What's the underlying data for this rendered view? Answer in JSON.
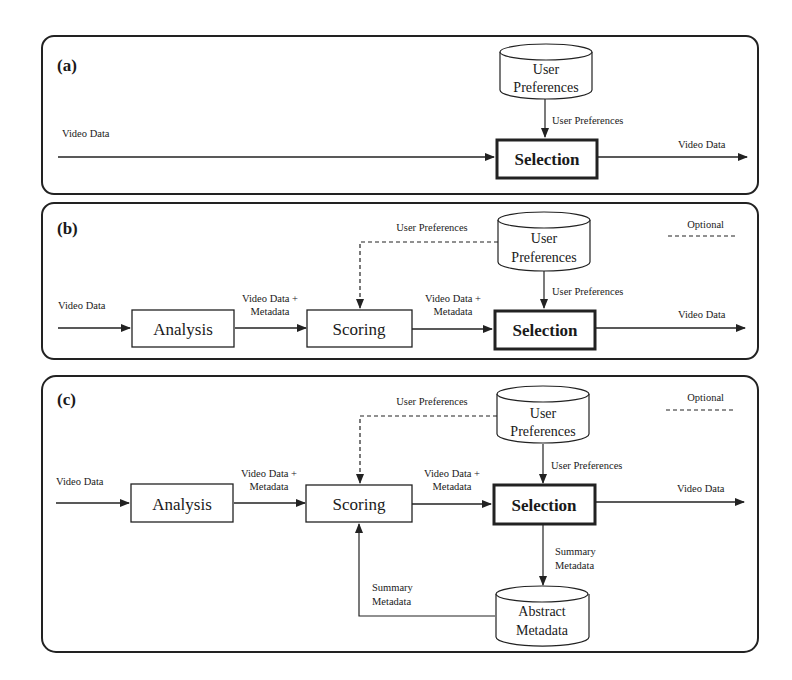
{
  "panels": [
    {
      "label": "(a)",
      "input_label": "Video Data",
      "output_label": "Video Data",
      "selection_label": "Selection",
      "prefs_store": [
        "User",
        "Preferences"
      ],
      "prefs_edge": "User Preferences"
    },
    {
      "label": "(b)",
      "input_label": "Video Data",
      "analysis_label": "Analysis",
      "edge_analysis_scoring": [
        "Video Data +",
        "Metadata"
      ],
      "scoring_label": "Scoring",
      "edge_scoring_selection": [
        "Video Data +",
        "Metadata"
      ],
      "selection_label": "Selection",
      "output_label": "Video Data",
      "prefs_store": [
        "User",
        "Preferences"
      ],
      "prefs_edge": "User Preferences",
      "prefs_optional_edge": "User Preferences",
      "legend_optional": "Optional"
    },
    {
      "label": "(c)",
      "input_label": "Video Data",
      "analysis_label": "Analysis",
      "edge_analysis_scoring": [
        "Video Data +",
        "Metadata"
      ],
      "scoring_label": "Scoring",
      "edge_scoring_selection": [
        "Video Data +",
        "Metadata"
      ],
      "selection_label": "Selection",
      "output_label": "Video Data",
      "prefs_store": [
        "User",
        "Preferences"
      ],
      "prefs_edge": "User Preferences",
      "prefs_optional_edge": "User Preferences",
      "legend_optional": "Optional",
      "summary_down_edge": [
        "Summary",
        "Metadata"
      ],
      "summary_up_edge": [
        "Summary",
        "Metadata"
      ],
      "abstract_store": [
        "Abstract",
        "Metadata"
      ]
    }
  ]
}
